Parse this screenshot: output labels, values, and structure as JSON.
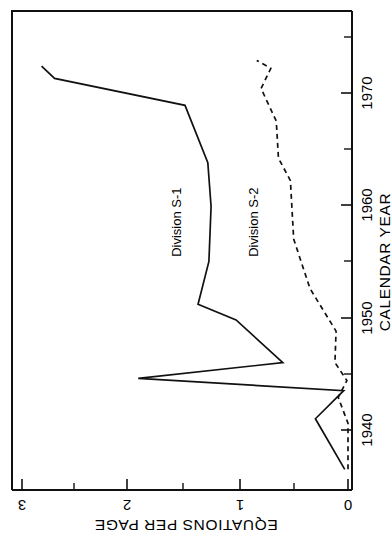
{
  "chart_data": {
    "type": "line",
    "title": "",
    "xlabel": "CALENDAR YEAR",
    "ylabel": "EQUATIONS PER PAGE",
    "orientation": "rotated-90-clockwise",
    "xlim": [
      1936,
      1978
    ],
    "ylim": [
      0,
      3
    ],
    "xticks": [
      1940,
      1950,
      1960,
      1970
    ],
    "xtick_labels": [
      "1940",
      "1950",
      "1960",
      "1970"
    ],
    "xtick_minor": [
      1945,
      1955,
      1965,
      1975
    ],
    "yticks": [
      0,
      1,
      2,
      3
    ],
    "ytick_labels": [
      "0",
      "1",
      "2",
      "3"
    ],
    "ytick_minor": [
      0.5,
      1.5,
      2.5
    ],
    "grid": false,
    "legend_position": "inline-annotation",
    "series": [
      {
        "name": "Division S-1",
        "label": "Division S-1",
        "style": "solid",
        "x": [
          1936.5,
          1941.0,
          1943.5,
          1944.6,
          1946.0,
          1949.8,
          1951.2,
          1955.0,
          1959.9,
          1963.8,
          1968.9,
          1971.3,
          1972.4
        ],
        "y": [
          0.03,
          0.3,
          0.04,
          1.93,
          0.6,
          1.03,
          1.38,
          1.28,
          1.26,
          1.29,
          1.5,
          2.7,
          2.82
        ]
      },
      {
        "name": "Division S-2",
        "label": "Division S-2",
        "style": "dashed",
        "x": [
          1936.5,
          1940.6,
          1942.9,
          1944.4,
          1946.0,
          1948.8,
          1952.6,
          1957.0,
          1962.2,
          1964.2,
          1967.5,
          1970.4,
          1972.2,
          1972.9
        ],
        "y": [
          0.0,
          0.0,
          0.09,
          0.01,
          0.12,
          0.11,
          0.35,
          0.5,
          0.53,
          0.64,
          0.66,
          0.8,
          0.71,
          0.84
        ]
      }
    ],
    "annotations": [
      {
        "text": "Division S-1",
        "x": 1958.5,
        "y": 1.57,
        "rotation": -90
      },
      {
        "text": "Division S-2",
        "x": 1958.5,
        "y": 0.86,
        "rotation": -90
      }
    ]
  },
  "axes": {
    "x_axis_title": "CALENDAR YEAR",
    "y_axis_title": "EQUATIONS PER PAGE",
    "year_ticks": [
      {
        "label": "1940"
      },
      {
        "label": "1950"
      },
      {
        "label": "1960"
      },
      {
        "label": "1970"
      }
    ],
    "value_ticks": [
      {
        "label": "3"
      },
      {
        "label": "2"
      },
      {
        "label": "1"
      },
      {
        "label": "0"
      }
    ]
  },
  "series_labels": {
    "s1": "Division S-1",
    "s2": "Division S-2"
  }
}
